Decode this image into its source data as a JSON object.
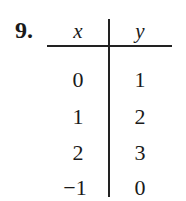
{
  "problem_number": "9.",
  "table": {
    "headers": [
      "x",
      "y"
    ],
    "rows": [
      [
        "0",
        "1"
      ],
      [
        "1",
        "2"
      ],
      [
        "2",
        "3"
      ],
      [
        "−1",
        "0"
      ]
    ]
  }
}
